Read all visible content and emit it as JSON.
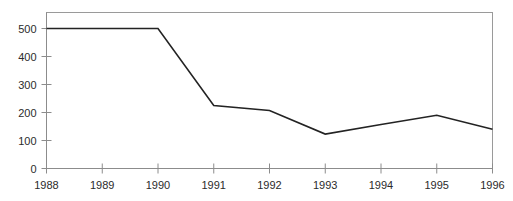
{
  "chart_data": {
    "type": "line",
    "title": "",
    "subtitle": "",
    "xlabel": "",
    "ylabel": "",
    "categories": [
      "1988",
      "1989",
      "1990",
      "1991",
      "1992",
      "1993",
      "1994",
      "1995",
      "1996"
    ],
    "x": [
      1988,
      1989,
      1990,
      1991,
      1992,
      1993,
      1994,
      1995,
      1996
    ],
    "values": [
      500,
      500,
      500,
      225,
      207,
      123,
      157,
      190,
      140
    ],
    "series": [
      {
        "name": "",
        "values": [
          500,
          500,
          500,
          225,
          207,
          123,
          157,
          190,
          140
        ]
      }
    ],
    "ylim": [
      0,
      550
    ],
    "xlim": [
      1988,
      1996
    ],
    "yticks": [
      0,
      100,
      200,
      300,
      400,
      500
    ],
    "ytick_labels": [
      "0",
      "100",
      "200",
      "300",
      "400",
      "500"
    ],
    "xticks": [
      1988,
      1989,
      1990,
      1991,
      1992,
      1993,
      1994,
      1995,
      1996
    ],
    "xtick_labels": [
      "1988",
      "1989",
      "1990",
      "1991",
      "1992",
      "1993",
      "1994",
      "1995",
      "1996"
    ],
    "grid": false,
    "legend": false,
    "legend_position": "none",
    "annotations": [],
    "colors": {
      "line": "#232323",
      "axis": "#8c8c8c",
      "frame": "#9a9a9a",
      "text": "#2b2b2b",
      "background": "#ffffff"
    },
    "line_width": 1.6
  },
  "axes": {
    "y_tick_labels": [
      "500",
      "400",
      "300",
      "200",
      "100",
      "0"
    ],
    "x_tick_labels": [
      "1988",
      "1989",
      "1990",
      "1991",
      "1992",
      "1993",
      "1994",
      "1995",
      "1996"
    ]
  }
}
